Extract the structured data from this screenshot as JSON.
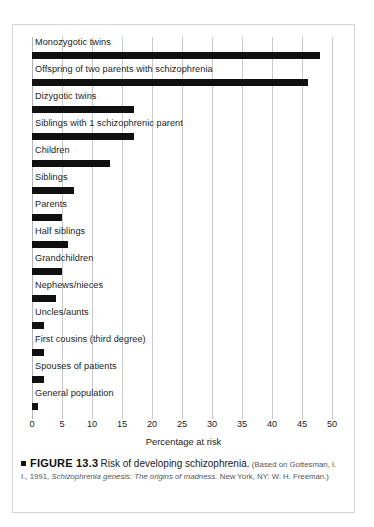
{
  "figure": {
    "bullet_icon": "black-square-icon",
    "number": "FIGURE 13.3",
    "title": "Risk of developing schizophrenia.",
    "source_prefix": "(Based on Gottesman, I. I., 1991,",
    "source_italic": "Schizophrenia genesis: The origins of madness.",
    "source_suffix": "New York, NY: W. H. Freeman.)"
  },
  "colors": {
    "bar": "#101010",
    "gridline": "#c9c9c9",
    "frame": "#d5d5d5",
    "text": "#1c1c1c",
    "background": "#ffffff"
  },
  "chart_data": {
    "type": "bar",
    "orientation": "horizontal",
    "title": "Risk of developing schizophrenia.",
    "xlabel": "Percentage at risk",
    "ylabel": "",
    "xlim": [
      0,
      50
    ],
    "xticks": [
      0,
      5,
      10,
      15,
      20,
      25,
      30,
      35,
      40,
      45,
      50
    ],
    "xtick_labels": [
      "0",
      "5",
      "10",
      "15",
      "20",
      "25",
      "30",
      "35",
      "40",
      "45",
      "50"
    ],
    "grid": "vertical",
    "legend": "none",
    "categories": [
      "Monozygotic twins",
      "Offspring of two parents with schizophrenia",
      "Dizygotic twins",
      "Siblings with 1 schizophrenic parent",
      "Children",
      "Siblings",
      "Parents",
      "Half siblings",
      "Grandchildren",
      "Nephews/nieces",
      "Uncles/aunts",
      "First cousins (third degree)",
      "Spouses of patients",
      "General population"
    ],
    "values": [
      48,
      46,
      17,
      17,
      13,
      7,
      5,
      6,
      5,
      4,
      2,
      2,
      2,
      1
    ],
    "units": "percent"
  }
}
